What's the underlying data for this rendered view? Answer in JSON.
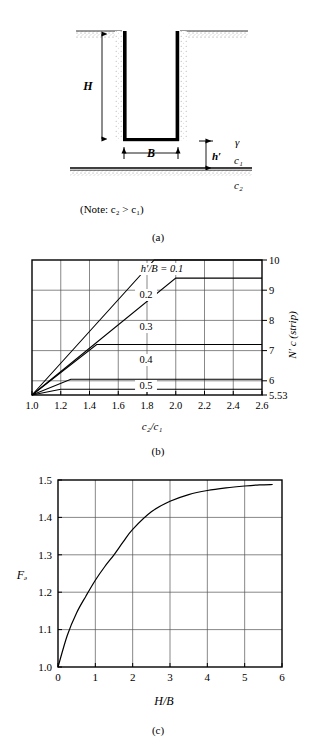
{
  "figure": {
    "panels": [
      {
        "id": "a",
        "caption": "(a)"
      },
      {
        "id": "b",
        "caption": "(b)"
      },
      {
        "id": "c",
        "caption": "(c)"
      }
    ]
  },
  "panel_a": {
    "caption": "(a)",
    "note": "(Note: c₂ > c₁)",
    "labels": {
      "depth": "H",
      "width": "B",
      "layer_thickness": "h′",
      "unit_weight": "γ",
      "cohesion_top": "c₁",
      "cohesion_bottom": "c₂"
    }
  },
  "panel_b": {
    "caption": "(b)"
  },
  "panel_c": {
    "caption": "(c)"
  },
  "chart_data": [
    {
      "id": "b",
      "type": "line",
      "title": "",
      "xlabel": "c₂/c₁",
      "ylabel": "N′ c (strip)",
      "xlim": [
        1.0,
        2.6
      ],
      "ylim": [
        5.53,
        10
      ],
      "grid": true,
      "xticks": [
        1.0,
        1.2,
        1.4,
        1.6,
        1.8,
        2.0,
        2.2,
        2.4,
        2.6
      ],
      "xticklabels": [
        "1.0",
        "1.2",
        "1.4",
        "1.6",
        "1.8",
        "2.0",
        "2.2",
        "2.4",
        "2.6"
      ],
      "yticks": [
        5.53,
        6,
        7,
        8,
        9,
        10
      ],
      "yticklabels": [
        "5.53",
        "6",
        "7",
        "8",
        "9",
        "10"
      ],
      "legend_title": "h′/B = 0.1",
      "series": [
        {
          "name": "0.1",
          "label": "h′/B = 0.1",
          "x": [
            1.0,
            1.85,
            2.6
          ],
          "values": [
            5.53,
            10.0,
            10.0
          ]
        },
        {
          "name": "0.2",
          "label": "0.2",
          "x": [
            1.0,
            2.0,
            2.6
          ],
          "values": [
            5.53,
            9.4,
            9.4
          ]
        },
        {
          "name": "0.3",
          "label": "0.3",
          "x": [
            1.0,
            1.45,
            2.6
          ],
          "values": [
            5.53,
            7.2,
            7.2
          ]
        },
        {
          "name": "0.4",
          "label": "0.4",
          "x": [
            1.0,
            1.27,
            2.6
          ],
          "values": [
            5.53,
            6.05,
            6.05
          ]
        },
        {
          "name": "0.5",
          "label": "0.5",
          "x": [
            1.0,
            1.2,
            2.6
          ],
          "values": [
            5.53,
            5.72,
            5.72
          ]
        }
      ]
    },
    {
      "id": "c",
      "type": "line",
      "title": "",
      "xlabel": "H/B",
      "ylabel": "Fₔ",
      "xlim": [
        0,
        6
      ],
      "ylim": [
        1.0,
        1.5
      ],
      "grid": true,
      "xticks": [
        0,
        1,
        2,
        3,
        4,
        5,
        6
      ],
      "xticklabels": [
        "0",
        "1",
        "2",
        "3",
        "4",
        "5",
        "6"
      ],
      "yticks": [
        1.0,
        1.1,
        1.2,
        1.3,
        1.4,
        1.5
      ],
      "yticklabels": [
        "1.0",
        "1.1",
        "1.2",
        "1.3",
        "1.4",
        "1.5"
      ],
      "series": [
        {
          "name": "Fd",
          "x": [
            0,
            0.25,
            0.5,
            0.75,
            1.0,
            1.25,
            1.5,
            1.75,
            2.0,
            2.5,
            3.0,
            3.5,
            4.0,
            4.5,
            5.0,
            5.4,
            5.75
          ],
          "values": [
            1.0,
            1.085,
            1.145,
            1.19,
            1.232,
            1.268,
            1.3,
            1.335,
            1.368,
            1.415,
            1.443,
            1.461,
            1.472,
            1.479,
            1.484,
            1.487,
            1.488
          ]
        }
      ]
    }
  ]
}
